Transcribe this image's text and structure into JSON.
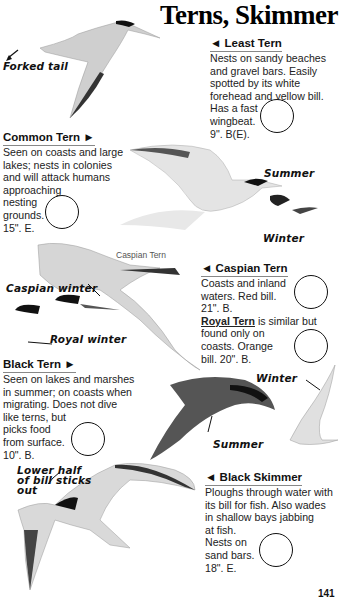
{
  "page": {
    "title": "Terns, Skimmer",
    "page_number": "141"
  },
  "species": [
    {
      "name": "Least Tern",
      "arrow": "◄",
      "lines": [
        "Nests on sandy beaches",
        "and gravel bars. Easily",
        "spotted by its white",
        "forehead and yellow bill.",
        "Has a fast",
        "wingbeat.",
        "9\". B(E)."
      ]
    },
    {
      "name": "Common Tern",
      "arrow": "►",
      "lines": [
        "Seen on coasts and large",
        "lakes; nests in colonies",
        "and will attack humans",
        "approaching",
        "nesting",
        "grounds.",
        "15\". E."
      ]
    },
    {
      "name": "Caspian Tern",
      "arrow": "◄",
      "lines": [
        "Coasts and inland",
        "waters. Red bill.",
        "21\". B."
      ],
      "sub": {
        "name": "Royal Tern",
        "rest_first": " is similar but",
        "lines": [
          "found only on",
          "coasts. Orange",
          "bill. 20\". B."
        ]
      }
    },
    {
      "name": "Black Tern",
      "arrow": "►",
      "lines": [
        "Seen on lakes and marshes",
        "in summer; on coasts when",
        "migrating. Does not dive",
        "like terns, but",
        "picks food",
        "from surface.",
        "10\". B."
      ]
    },
    {
      "name": "Black Skimmer",
      "arrow": "◄",
      "lines": [
        "Ploughs through water with",
        "its bill for fish. Also wades",
        "in shallow bays jabbing",
        "at fish.",
        "Nests on",
        "sand bars.",
        "18\". E."
      ]
    }
  ],
  "illustration_labels": {
    "forked_tail": "Forked tail",
    "summer_common": "Summer",
    "winter_common": "Winter",
    "caspian_caption": "Caspian Tern",
    "caspian_winter": "Caspian winter",
    "royal_winter": "Royal winter",
    "winter_black": "Winter",
    "summer_black": "Summer",
    "skimmer_note_1": "Lower half",
    "skimmer_note_2": "of bill sticks",
    "skimmer_note_3": "out"
  }
}
